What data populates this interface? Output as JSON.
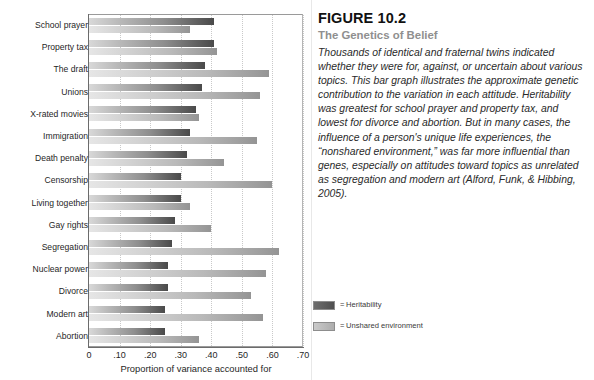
{
  "figure": {
    "number": "FIGURE 10.2",
    "title": "The Genetics of Belief",
    "body": "Thousands of identical and fraternal twins indicated whether they were for, against, or uncertain about various topics. This bar graph illustrates the approximate genetic contribution to the variation in each attitude.  Heritability was greatest for school prayer and property tax, and lowest for divorce and abortion. But in many cases, the influence of a person's unique life experiences, the “nonshared environment,” was far more influential than genes, especially on attitudes toward topics as unrelated as segregation and modern art (Alford, Funk, & Hibbing, 2005)."
  },
  "legend": {
    "equals": "=",
    "items": [
      {
        "label": "Heritability",
        "color": "#4f4f4f",
        "swatch": "sw-heritability"
      },
      {
        "label": "Unshared environment",
        "color": "#adadad",
        "swatch": "sw-unshared"
      }
    ]
  },
  "chart_data": {
    "type": "bar",
    "orientation": "horizontal",
    "title": "The Genetics of Belief",
    "xlabel": "Proportion of variance accounted for",
    "ylabel": "",
    "xlim": [
      0,
      0.7
    ],
    "xticks": [
      0,
      0.1,
      0.2,
      0.3,
      0.4,
      0.5,
      0.6,
      0.7
    ],
    "xticklabels": [
      "0",
      ".10",
      ".20",
      ".30",
      ".40",
      ".50",
      ".60",
      ".70"
    ],
    "grid": "vertical-dotted",
    "legend_position": "outside-bottom-right",
    "categories": [
      "School prayer",
      "Property tax",
      "The draft",
      "Unions",
      "X-rated movies",
      "Immigration",
      "Death penalty",
      "Censorship",
      "Living together",
      "Gay rights",
      "Segregation",
      "Nuclear power",
      "Divorce",
      "Modern art",
      "Abortion"
    ],
    "series": [
      {
        "name": "Heritability",
        "color": "#4f4f4f",
        "values": [
          0.41,
          0.41,
          0.38,
          0.37,
          0.35,
          0.33,
          0.32,
          0.3,
          0.3,
          0.28,
          0.27,
          0.26,
          0.26,
          0.25,
          0.25
        ]
      },
      {
        "name": "Unshared environment",
        "color": "#adadad",
        "values": [
          0.33,
          0.42,
          0.59,
          0.56,
          0.36,
          0.55,
          0.44,
          0.6,
          0.33,
          0.4,
          0.62,
          0.58,
          0.53,
          0.57,
          0.36
        ]
      }
    ]
  }
}
